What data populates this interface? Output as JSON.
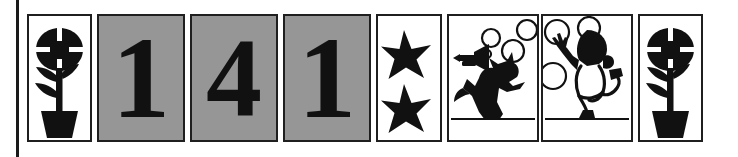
{
  "page": {
    "background_color": "#ffffff",
    "ink_color": "#1f1f1f",
    "gray_card_color": "#969696",
    "frame_rule_name": "left-margin-rule"
  },
  "cards": [
    {
      "index": 1,
      "kind": "picture",
      "content": "flower-in-pot",
      "label": "flower in a pot",
      "background": "#ffffff",
      "text": ""
    },
    {
      "index": 2,
      "kind": "digit",
      "content": "digit-one",
      "label": "numeral one",
      "background": "#969696",
      "text": "1"
    },
    {
      "index": 3,
      "kind": "digit",
      "content": "digit-four",
      "label": "numeral four",
      "background": "#969696",
      "text": "4"
    },
    {
      "index": 4,
      "kind": "digit",
      "content": "digit-one",
      "label": "numeral one",
      "background": "#969696",
      "text": "1"
    },
    {
      "index": 5,
      "kind": "picture",
      "content": "two-stars",
      "label": "two five-pointed stars",
      "background": "#ffffff",
      "text": ""
    },
    {
      "index": 6,
      "kind": "picture",
      "content": "cat-with-trumpet",
      "label": "cat playing a trumpet with bubbles",
      "background": "#ffffff",
      "text": ""
    },
    {
      "index": 7,
      "kind": "picture",
      "content": "dancing-child",
      "label": "child dancing with bubbles",
      "background": "#ffffff",
      "text": ""
    },
    {
      "index": 8,
      "kind": "picture",
      "content": "flower-in-pot",
      "label": "flower in a pot",
      "background": "#ffffff",
      "text": ""
    }
  ],
  "sequence_text": "141"
}
